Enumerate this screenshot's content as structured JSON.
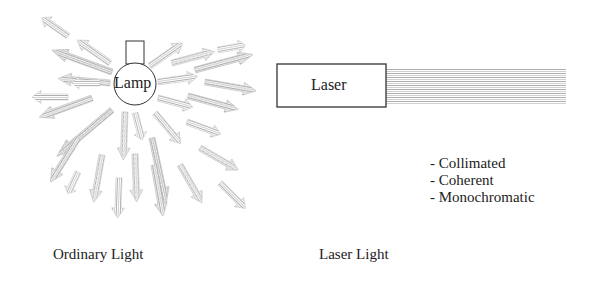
{
  "diagram": {
    "ordinary": {
      "lamp_label": "Lamp",
      "caption": "Ordinary Light",
      "arrow_count": 30
    },
    "laser": {
      "box_label": "Laser",
      "caption": "Laser Light",
      "properties": [
        "- Collimated",
        "- Coherent",
        "- Monochromatic"
      ]
    },
    "colors": {
      "stroke": "#333333",
      "beam": "#b4b4b4",
      "text": "#222222"
    }
  }
}
